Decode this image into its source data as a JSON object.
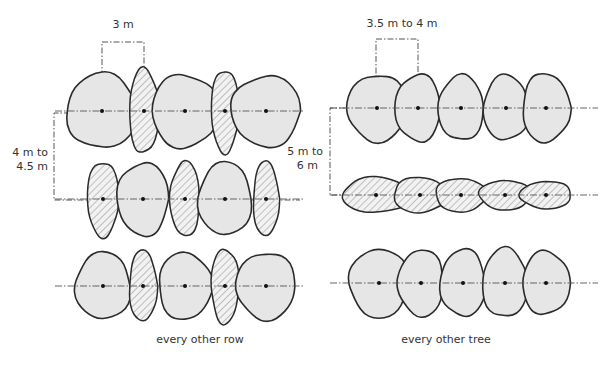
{
  "diagram": {
    "panels": [
      {
        "id": "left",
        "caption": "every other row",
        "horizontal_dimension": "3 m",
        "vertical_dimension_line1": "4 m to",
        "vertical_dimension_line2": "4.5 m",
        "rows": [
          {
            "y": 111,
            "trees": [
              {
                "x": 102,
                "type": "crown",
                "rx": 36,
                "ry": 38
              },
              {
                "x": 144,
                "type": "hatched",
                "rx": 15,
                "ry": 43
              },
              {
                "x": 185,
                "type": "crown",
                "rx": 34,
                "ry": 37
              },
              {
                "x": 225,
                "type": "hatched",
                "rx": 14,
                "ry": 42
              },
              {
                "x": 266,
                "type": "crown",
                "rx": 35,
                "ry": 36
              }
            ]
          },
          {
            "y": 199,
            "trees": [
              {
                "x": 103,
                "type": "hatched",
                "rx": 16,
                "ry": 38
              },
              {
                "x": 143,
                "type": "crown",
                "rx": 26,
                "ry": 37
              },
              {
                "x": 185,
                "type": "hatched",
                "rx": 15,
                "ry": 38
              },
              {
                "x": 225,
                "type": "crown",
                "rx": 27,
                "ry": 37
              },
              {
                "x": 266,
                "type": "hatched",
                "rx": 13,
                "ry": 38
              }
            ]
          },
          {
            "y": 286,
            "trees": [
              {
                "x": 103,
                "type": "crown",
                "rx": 28,
                "ry": 34
              },
              {
                "x": 143,
                "type": "hatched",
                "rx": 14,
                "ry": 36
              },
              {
                "x": 185,
                "type": "crown",
                "rx": 27,
                "ry": 34
              },
              {
                "x": 225,
                "type": "hatched",
                "rx": 14,
                "ry": 38
              },
              {
                "x": 266,
                "type": "crown",
                "rx": 30,
                "ry": 34
              }
            ]
          }
        ]
      },
      {
        "id": "right",
        "caption": "every other tree",
        "horizontal_dimension": "3.5 m to 4 m",
        "vertical_dimension_line1": "5 m to",
        "vertical_dimension_line2": "6 m",
        "rows": [
          {
            "y": 108,
            "trees": [
              {
                "x": 377,
                "type": "crown",
                "rx": 30,
                "ry": 34
              },
              {
                "x": 418,
                "type": "crown",
                "rx": 23,
                "ry": 34
              },
              {
                "x": 461,
                "type": "crown",
                "rx": 23,
                "ry": 33
              },
              {
                "x": 506,
                "type": "crown",
                "rx": 23,
                "ry": 33
              },
              {
                "x": 546,
                "type": "crown",
                "rx": 24,
                "ry": 35
              }
            ]
          },
          {
            "y": 195,
            "trees": [
              {
                "x": 376,
                "type": "hatched",
                "rx": 34,
                "ry": 18
              },
              {
                "x": 420,
                "type": "hatched",
                "rx": 27,
                "ry": 18
              },
              {
                "x": 461,
                "type": "hatched",
                "rx": 26,
                "ry": 17
              },
              {
                "x": 505,
                "type": "hatched",
                "rx": 26,
                "ry": 15
              },
              {
                "x": 546,
                "type": "hatched",
                "rx": 26,
                "ry": 14
              }
            ]
          },
          {
            "y": 283,
            "trees": [
              {
                "x": 379,
                "type": "crown",
                "rx": 30,
                "ry": 35
              },
              {
                "x": 421,
                "type": "crown",
                "rx": 23,
                "ry": 34
              },
              {
                "x": 463,
                "type": "crown",
                "rx": 23,
                "ry": 34
              },
              {
                "x": 505,
                "type": "crown",
                "rx": 23,
                "ry": 35
              },
              {
                "x": 546,
                "type": "crown",
                "rx": 24,
                "ry": 32
              }
            ]
          }
        ]
      }
    ],
    "colors": {
      "crown_fill": "#e6e6e6",
      "outline": "#2a2a2a",
      "hatch": "#8a8a8a",
      "text": "#333333"
    }
  }
}
